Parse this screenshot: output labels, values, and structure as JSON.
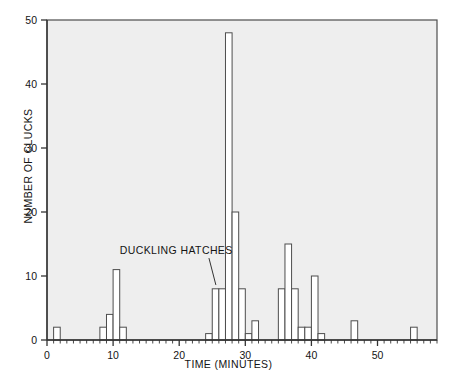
{
  "chart_data": {
    "type": "bar",
    "title": "",
    "subtitle": "",
    "xlabel": "TIME (MINUTES)",
    "ylabel": "NUMBER OF CLUCKS",
    "xlim": [
      0,
      59
    ],
    "ylim": [
      0,
      50
    ],
    "xticks": [
      0,
      10,
      20,
      30,
      40,
      50
    ],
    "yticks": [
      0,
      10,
      20,
      30,
      40,
      50
    ],
    "xtick_labels": [
      "0",
      "10",
      "20",
      "30",
      "40",
      "50"
    ],
    "ytick_labels": [
      "0",
      "10",
      "20",
      "30",
      "40",
      "50"
    ],
    "grid": false,
    "legend": null,
    "bar_width_minutes": 1,
    "x": [
      1,
      8,
      9,
      10,
      11,
      24,
      25,
      26,
      27,
      28,
      29,
      30,
      31,
      35,
      36,
      37,
      38,
      39,
      40,
      41,
      46,
      55
    ],
    "values": [
      2,
      2,
      4,
      11,
      2,
      1,
      8,
      8,
      48,
      20,
      8,
      1,
      3,
      8,
      15,
      8,
      2,
      2,
      10,
      1,
      3,
      2
    ],
    "bars": [
      {
        "x": 1,
        "value": 2
      },
      {
        "x": 8,
        "value": 2
      },
      {
        "x": 9,
        "value": 4
      },
      {
        "x": 10,
        "value": 11
      },
      {
        "x": 11,
        "value": 2
      },
      {
        "x": 24,
        "value": 1
      },
      {
        "x": 25,
        "value": 8
      },
      {
        "x": 26,
        "value": 8
      },
      {
        "x": 27,
        "value": 48
      },
      {
        "x": 28,
        "value": 20
      },
      {
        "x": 29,
        "value": 8
      },
      {
        "x": 30,
        "value": 1
      },
      {
        "x": 31,
        "value": 3
      },
      {
        "x": 35,
        "value": 8
      },
      {
        "x": 36,
        "value": 15
      },
      {
        "x": 37,
        "value": 8
      },
      {
        "x": 38,
        "value": 2
      },
      {
        "x": 39,
        "value": 2
      },
      {
        "x": 40,
        "value": 10
      },
      {
        "x": 41,
        "value": 1
      },
      {
        "x": 46,
        "value": 3
      },
      {
        "x": 55,
        "value": 2
      }
    ],
    "annotations": [
      {
        "text": "DUCKLING HATCHES",
        "target_x": 25,
        "target_y": 8,
        "label_x": 11,
        "label_y": 14
      }
    ],
    "colors": {
      "plot_background": "#eeeeee",
      "bar_fill": "#ffffff",
      "bar_edge": "#4d4d4d",
      "axis_line": "#333333",
      "text": "#141414",
      "figure_background": "#ffffff"
    }
  }
}
